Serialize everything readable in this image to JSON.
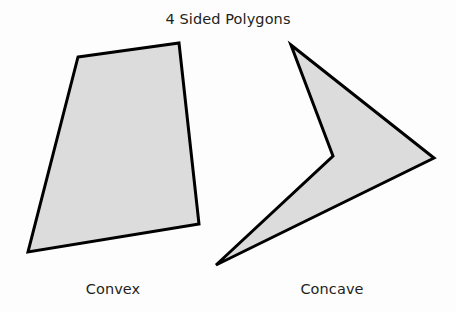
{
  "figure": {
    "title": "4 Sided Polygons",
    "background_color": "#fdfdfd",
    "shapes": [
      {
        "id": "convex-polygon",
        "caption": "Convex",
        "sides": 4,
        "classification": "convex",
        "fill_color": "#dcdcdc",
        "stroke_color": "#000000",
        "stroke_width": 3,
        "points": "78,57 179,43 199,224 28,252"
      },
      {
        "id": "concave-polygon",
        "caption": "Concave",
        "sides": 4,
        "classification": "concave",
        "fill_color": "#dcdcdc",
        "stroke_color": "#000000",
        "stroke_width": 3,
        "points": "291,45 434,158 216,265 333,156"
      }
    ]
  }
}
